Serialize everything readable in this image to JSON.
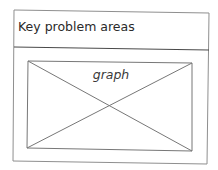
{
  "panel": {
    "title": "Key problem areas",
    "placeholder": {
      "label": "graph",
      "type": "image-placeholder"
    }
  },
  "colors": {
    "stroke": "#8a8a8a",
    "header_divider": "#4a4a4a",
    "text": "#2a2a2a"
  }
}
